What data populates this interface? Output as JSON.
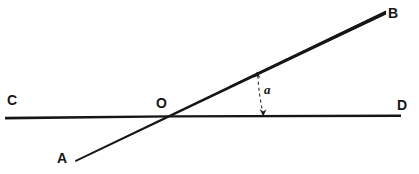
{
  "figure": {
    "type": "geometry-diagram",
    "background_color": "#ffffff",
    "ink_color": "#161616",
    "width": 419,
    "height": 174
  },
  "labels": {
    "A": "A",
    "B": "B",
    "C": "C",
    "D": "D",
    "O": "O",
    "angle": "a"
  },
  "geometry": {
    "line_AB": {
      "name": "line-AB",
      "from": {
        "x": 75,
        "y": 161
      },
      "to": {
        "x": 386,
        "y": 12
      },
      "stroke_start_width": 1.7,
      "stroke_end_width": 3.4
    },
    "line_CD": {
      "name": "line-CD",
      "from": {
        "x": 5,
        "y": 116
      },
      "to": {
        "x": 401,
        "y": 115
      },
      "stroke_start_width": 2.6,
      "stroke_end_width": 2.2
    },
    "intersection_O": {
      "x": 168,
      "y": 114
    },
    "angle_marker": {
      "name": "angle-marker-a",
      "top": {
        "x": 257,
        "y": 73
      },
      "bottom": {
        "x": 263,
        "y": 114
      },
      "dash_pattern": "3 3",
      "double_headed": true
    }
  }
}
